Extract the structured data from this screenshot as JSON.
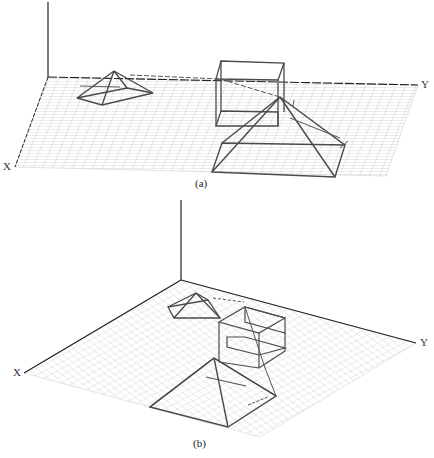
{
  "figure_a": {
    "caption": "(a)",
    "axis_x_label": "X",
    "axis_y_label": "Y",
    "objects": [
      "small-pyramid",
      "wire-box",
      "large-pyramid",
      "path-arrow"
    ]
  },
  "figure_b": {
    "caption": "(b)",
    "axis_x_label": "X",
    "axis_y_label": "Y",
    "objects": [
      "small-pyramid",
      "stacked-wire-boxes",
      "large-pyramid",
      "path-arrow"
    ]
  },
  "colors": {
    "grid": "#c8c8c8",
    "axis": "#222222",
    "object": "#4a4a4a",
    "background": "#ffffff"
  }
}
